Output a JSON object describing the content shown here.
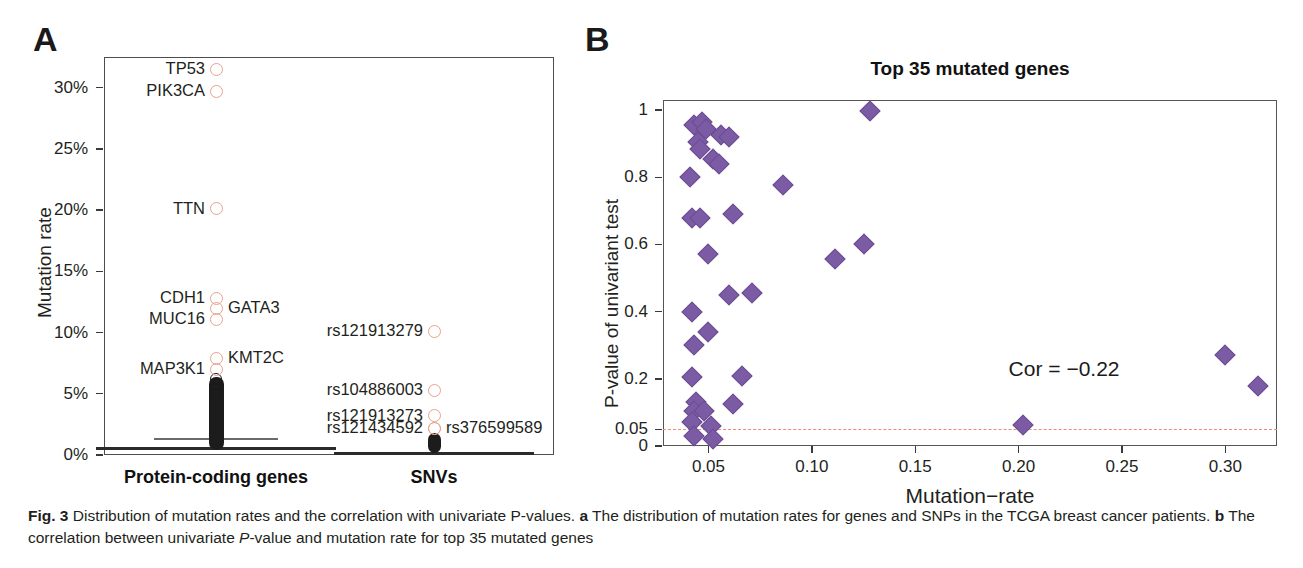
{
  "panels": {
    "a": {
      "letter": "A"
    },
    "b": {
      "letter": "B"
    }
  },
  "caption": {
    "fig_label": "Fig. 3",
    "line1_main": " Distribution of mutation rates and the correlation with univariate P-values. ",
    "a_label": "a",
    "a_text": " The distribution of mutation rates for genes and SNPs in the TCGA breast cancer patients. ",
    "b_label": "b",
    "b_text_1": " The correlation between univariate ",
    "b_italic": "P",
    "b_text_2": "-value and mutation rate for top 35 mutated genes"
  },
  "chart_data": [
    {
      "type": "scatter",
      "panel": "a",
      "title": "",
      "xlabel": "",
      "ylabel": "Mutation rate",
      "ylim": [
        0,
        0.325
      ],
      "ytick_labels": [
        "0%",
        "5%",
        "10%",
        "15%",
        "20%",
        "25%",
        "30%"
      ],
      "ytick_values": [
        0,
        0.05,
        0.1,
        0.15,
        0.2,
        0.25,
        0.3
      ],
      "group_labels": [
        "Protein-coding genes",
        "SNVs"
      ],
      "marker_color": "#e9a18f",
      "grid": false,
      "labeled_points": [
        {
          "label": "TP53",
          "group": "Protein-coding genes",
          "value": 0.315,
          "label_side": "left"
        },
        {
          "label": "PIK3CA",
          "group": "Protein-coding genes",
          "value": 0.297,
          "label_side": "left"
        },
        {
          "label": "TTN",
          "group": "Protein-coding genes",
          "value": 0.201,
          "label_side": "left"
        },
        {
          "label": "CDH1",
          "group": "Protein-coding genes",
          "value": 0.128,
          "label_side": "left"
        },
        {
          "label": "GATA3",
          "group": "Protein-coding genes",
          "value": 0.12,
          "label_side": "right"
        },
        {
          "label": "MUC16",
          "group": "Protein-coding genes",
          "value": 0.111,
          "label_side": "left"
        },
        {
          "label": "KMT2C",
          "group": "Protein-coding genes",
          "value": 0.079,
          "label_side": "right"
        },
        {
          "label": "MAP3K1",
          "group": "Protein-coding genes",
          "value": 0.07,
          "label_side": "left"
        },
        {
          "label": "rs121913279",
          "group": "SNVs",
          "value": 0.101,
          "label_side": "left"
        },
        {
          "label": "rs104886003",
          "group": "SNVs",
          "value": 0.053,
          "label_side": "left"
        },
        {
          "label": "rs121913273",
          "group": "SNVs",
          "value": 0.032,
          "label_side": "left"
        },
        {
          "label": "rs121434592",
          "group": "SNVs",
          "value": 0.022,
          "label_side": "left"
        },
        {
          "label": "rs376599589",
          "group": "SNVs",
          "value": 0.022,
          "label_side": "right"
        }
      ],
      "boxplots": [
        {
          "group": "Protein-coding genes",
          "median": 0.006,
          "whisker_low": 0.0,
          "whisker_high": 0.013
        },
        {
          "group": "SNVs",
          "median": 0.002,
          "whisker_low": 0.0,
          "whisker_high": 0.004
        }
      ]
    },
    {
      "type": "scatter",
      "panel": "b",
      "title": "Top 35 mutated genes",
      "xlabel": "Mutation−rate",
      "ylabel": "P-value of univariant test",
      "xlim": [
        0.028,
        0.325
      ],
      "ylim": [
        0,
        1.03
      ],
      "xtick_labels": [
        "0.05",
        "0.10",
        "0.15",
        "0.20",
        "0.25",
        "0.30"
      ],
      "xtick_values": [
        0.05,
        0.1,
        0.15,
        0.2,
        0.25,
        0.3
      ],
      "ytick_labels": [
        "0",
        "0.05",
        "0.2",
        "0.4",
        "0.6",
        "0.8",
        "1"
      ],
      "ytick_values": [
        0,
        0.05,
        0.2,
        0.4,
        0.6,
        0.8,
        1
      ],
      "marker_color": "#7b5ba3",
      "significance_line": {
        "y": 0.05,
        "color": "#ec8b76",
        "style": "dashed"
      },
      "annotation": "Cor = −0.22",
      "grid": false,
      "points": [
        {
          "x": 0.043,
          "y": 0.955
        },
        {
          "x": 0.047,
          "y": 0.965
        },
        {
          "x": 0.049,
          "y": 0.945
        },
        {
          "x": 0.045,
          "y": 0.905
        },
        {
          "x": 0.046,
          "y": 0.885
        },
        {
          "x": 0.056,
          "y": 0.925
        },
        {
          "x": 0.06,
          "y": 0.92
        },
        {
          "x": 0.052,
          "y": 0.855
        },
        {
          "x": 0.055,
          "y": 0.84
        },
        {
          "x": 0.128,
          "y": 0.998
        },
        {
          "x": 0.041,
          "y": 0.8
        },
        {
          "x": 0.086,
          "y": 0.778
        },
        {
          "x": 0.042,
          "y": 0.68
        },
        {
          "x": 0.046,
          "y": 0.678
        },
        {
          "x": 0.062,
          "y": 0.692
        },
        {
          "x": 0.111,
          "y": 0.556
        },
        {
          "x": 0.125,
          "y": 0.601
        },
        {
          "x": 0.05,
          "y": 0.572
        },
        {
          "x": 0.06,
          "y": 0.45
        },
        {
          "x": 0.071,
          "y": 0.455
        },
        {
          "x": 0.042,
          "y": 0.398
        },
        {
          "x": 0.05,
          "y": 0.34
        },
        {
          "x": 0.043,
          "y": 0.301
        },
        {
          "x": 0.066,
          "y": 0.207
        },
        {
          "x": 0.042,
          "y": 0.205
        },
        {
          "x": 0.044,
          "y": 0.131
        },
        {
          "x": 0.062,
          "y": 0.125
        },
        {
          "x": 0.043,
          "y": 0.105
        },
        {
          "x": 0.048,
          "y": 0.103
        },
        {
          "x": 0.042,
          "y": 0.072
        },
        {
          "x": 0.051,
          "y": 0.06
        },
        {
          "x": 0.043,
          "y": 0.03
        },
        {
          "x": 0.052,
          "y": 0.022
        },
        {
          "x": 0.202,
          "y": 0.062
        },
        {
          "x": 0.3,
          "y": 0.27
        },
        {
          "x": 0.316,
          "y": 0.18
        }
      ]
    }
  ]
}
